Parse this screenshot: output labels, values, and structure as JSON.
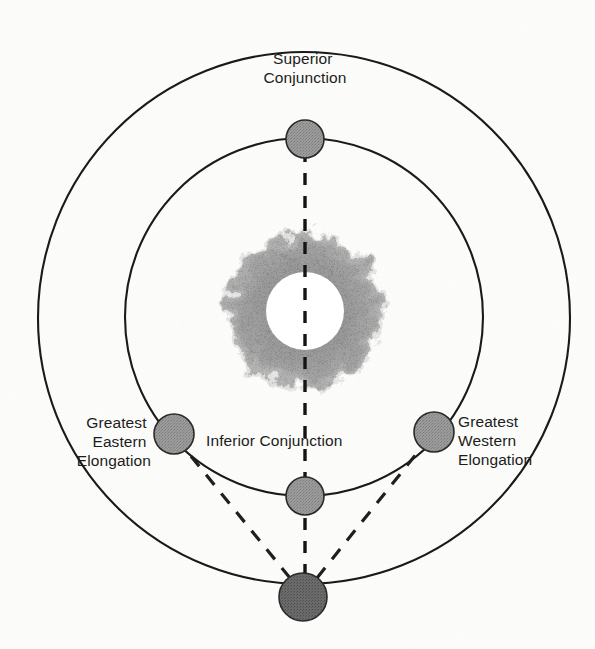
{
  "diagram": {
    "background_color": "#fdfdfb",
    "line_color": "#1a1a1a",
    "labels": {
      "superior_conjunction": {
        "line1": "Superior",
        "line2": "Conjunction"
      },
      "inferior_conjunction": {
        "line1": "Inferior Conjunction"
      },
      "greatest_eastern_elongation": {
        "line1": "Greatest",
        "line2": "Eastern",
        "line3": "Elongation"
      },
      "greatest_western_elongation": {
        "line1": "Greatest",
        "line2": "Western",
        "line3": "Elongation"
      }
    },
    "sun": {
      "name": "sun",
      "center_x": 305,
      "center_y": 311,
      "disc_radius": 38,
      "corona_radius": 85,
      "disc_color": "#ffffff",
      "corona_color": "#9a9a9a"
    },
    "orbits": [
      {
        "name": "outer-orbit-earth",
        "center_x": 304,
        "center_y": 318,
        "radius": 266
      },
      {
        "name": "inner-orbit-inferior-planet",
        "center_x": 304,
        "center_y": 317,
        "radius": 179
      }
    ],
    "bodies": [
      {
        "name": "planet-superior-conjunction",
        "center_x": 305,
        "center_y": 139,
        "radius": 19,
        "fill": "#8e8e8e"
      },
      {
        "name": "planet-inferior-conjunction",
        "center_x": 305,
        "center_y": 496,
        "radius": 19,
        "fill": "#8e8e8e"
      },
      {
        "name": "planet-greatest-eastern-elongation",
        "center_x": 174,
        "center_y": 434,
        "radius": 20,
        "fill": "#959595"
      },
      {
        "name": "planet-greatest-western-elongation",
        "center_x": 434,
        "center_y": 432,
        "radius": 20,
        "fill": "#959595"
      },
      {
        "name": "earth",
        "center_x": 303,
        "center_y": 597,
        "radius": 24,
        "fill": "#5e5e5e"
      }
    ],
    "sight_lines": [
      {
        "name": "sight-line-earth-to-eastern-elongation",
        "x1": 290,
        "y1": 578,
        "x2": 186,
        "y2": 450
      },
      {
        "name": "sight-line-earth-to-western-elongation",
        "x1": 317,
        "y1": 578,
        "x2": 421,
        "y2": 448
      }
    ],
    "axis_line": {
      "name": "sun-earth-axis-line",
      "x": 305,
      "y_top": 150,
      "y_bottom": 580
    }
  }
}
